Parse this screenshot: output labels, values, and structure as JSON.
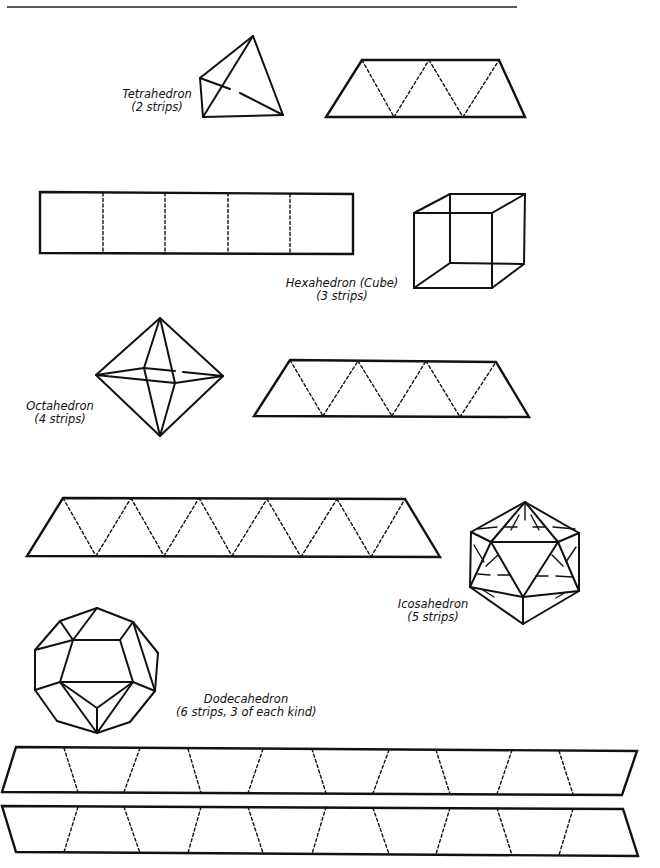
{
  "page": {
    "rule": {
      "x1": 7,
      "y1": 7,
      "x2": 517,
      "y2": 7
    },
    "colors": {
      "ink": "#111111",
      "paper": "#ffffff"
    }
  },
  "labels": {
    "tetrahedron": {
      "name": "Tetrahedron",
      "strips": "(2 strips)"
    },
    "hexahedron": {
      "name": "Hexahedron (Cube)",
      "strips": "(3 strips)"
    },
    "octahedron": {
      "name": "Octahedron",
      "strips": "(4 strips)"
    },
    "icosahedron": {
      "name": "Icosahedron",
      "strips": "(5 strips)"
    },
    "dodecahedron": {
      "name": "Dodecahedron",
      "strips": "(6 strips, 3 of each kind)"
    }
  },
  "solids": {
    "tetrahedron": {
      "solid": [
        [
          253,
          36,
          200,
          78
        ],
        [
          200,
          78,
          203,
          117
        ],
        [
          203,
          117,
          283,
          115
        ],
        [
          283,
          115,
          253,
          36
        ],
        [
          253,
          36,
          203,
          117
        ],
        [
          200,
          78,
          230,
          89
        ],
        [
          240,
          93,
          283,
          115
        ]
      ]
    },
    "cube": {
      "solid": [
        [
          414,
          213,
          492,
          213
        ],
        [
          492,
          213,
          492,
          288
        ],
        [
          492,
          288,
          414,
          288
        ],
        [
          414,
          288,
          414,
          213
        ],
        [
          414,
          213,
          450,
          194
        ],
        [
          450,
          194,
          525,
          194
        ],
        [
          525,
          194,
          492,
          213
        ],
        [
          525,
          194,
          524,
          264
        ],
        [
          524,
          264,
          492,
          288
        ],
        [
          414,
          288,
          450,
          263
        ],
        [
          450,
          263,
          524,
          264
        ],
        [
          450,
          194,
          450,
          263
        ]
      ]
    },
    "octahedron": {
      "solid": [
        [
          160,
          318,
          96,
          375
        ],
        [
          160,
          318,
          223,
          376
        ],
        [
          160,
          436,
          96,
          375
        ],
        [
          160,
          436,
          223,
          376
        ],
        [
          96,
          375,
          175,
          383
        ],
        [
          175,
          383,
          223,
          376
        ],
        [
          160,
          318,
          175,
          383
        ],
        [
          175,
          383,
          160,
          436
        ],
        [
          96,
          375,
          144,
          368
        ],
        [
          144,
          368,
          160,
          318
        ],
        [
          144,
          368,
          160,
          436
        ],
        [
          144,
          368,
          175,
          371
        ],
        [
          183,
          372,
          223,
          376
        ]
      ]
    },
    "icosahedron": {
      "solid": [
        [
          525,
          502,
          579,
          533
        ],
        [
          579,
          533,
          579,
          591
        ],
        [
          579,
          591,
          523,
          624
        ],
        [
          523,
          624,
          470,
          587
        ],
        [
          470,
          587,
          471,
          532
        ],
        [
          471,
          532,
          525,
          502
        ],
        [
          491,
          542,
          558,
          542
        ],
        [
          558,
          542,
          523,
          597
        ],
        [
          523,
          597,
          491,
          542
        ],
        [
          525,
          502,
          491,
          542
        ],
        [
          525,
          502,
          558,
          542
        ],
        [
          471,
          532,
          491,
          542
        ],
        [
          579,
          533,
          558,
          542
        ],
        [
          470,
          587,
          491,
          542
        ],
        [
          470,
          587,
          523,
          597
        ],
        [
          579,
          591,
          558,
          542
        ],
        [
          579,
          591,
          523,
          597
        ],
        [
          523,
          624,
          523,
          597
        ]
      ],
      "hidden": [
        [
          477,
          529,
          497,
          527
        ],
        [
          505,
          527,
          517,
          527
        ],
        [
          533,
          527,
          545,
          527
        ],
        [
          553,
          527,
          575,
          529
        ],
        [
          525,
          502,
          525,
          520
        ],
        [
          519,
          515,
          511,
          530
        ],
        [
          531,
          515,
          539,
          530
        ],
        [
          474,
          545,
          484,
          562
        ],
        [
          478,
          574,
          490,
          575
        ],
        [
          498,
          575,
          510,
          575
        ],
        [
          536,
          576,
          548,
          576
        ],
        [
          556,
          576,
          572,
          577
        ],
        [
          576,
          547,
          566,
          562
        ],
        [
          483,
          590,
          494,
          597
        ],
        [
          566,
          592,
          556,
          598
        ],
        [
          486,
          566,
          498,
          555
        ],
        [
          563,
          566,
          552,
          555
        ]
      ]
    },
    "dodecahedron": {
      "solid": [
        [
          97,
          608,
          133,
          622
        ],
        [
          133,
          622,
          158,
          653
        ],
        [
          158,
          653,
          155,
          691
        ],
        [
          155,
          691,
          130,
          722
        ],
        [
          130,
          722,
          97,
          733
        ],
        [
          97,
          733,
          57,
          721
        ],
        [
          57,
          721,
          35,
          690
        ],
        [
          35,
          690,
          35,
          650
        ],
        [
          35,
          650,
          60,
          621
        ],
        [
          60,
          621,
          97,
          608
        ],
        [
          73,
          640,
          120,
          640
        ],
        [
          120,
          640,
          133,
          682
        ],
        [
          133,
          682,
          97,
          708
        ],
        [
          97,
          708,
          60,
          682
        ],
        [
          60,
          682,
          73,
          640
        ],
        [
          73,
          640,
          60,
          621
        ],
        [
          73,
          640,
          35,
          650
        ],
        [
          73,
          640,
          97,
          608
        ],
        [
          120,
          640,
          133,
          622
        ],
        [
          133,
          622,
          155,
          691
        ],
        [
          133,
          682,
          155,
          691
        ],
        [
          60,
          682,
          35,
          690
        ],
        [
          60,
          682,
          97,
          733
        ],
        [
          133,
          682,
          97,
          733
        ],
        [
          97,
          708,
          97,
          733
        ],
        [
          60,
          682,
          133,
          682
        ]
      ]
    }
  },
  "strips": {
    "tetrahedron_strip": {
      "outline": [
        [
          362,
          60
        ],
        [
          499,
          60
        ],
        [
          525,
          117
        ],
        [
          326,
          117
        ]
      ],
      "folds": [
        [
          362,
          60,
          394,
          117
        ],
        [
          394,
          117,
          429,
          60
        ],
        [
          429,
          60,
          463,
          117
        ],
        [
          463,
          117,
          499,
          60
        ]
      ]
    },
    "cube_strip": {
      "outline": [
        [
          40,
          192
        ],
        [
          353,
          194
        ],
        [
          353,
          254
        ],
        [
          40,
          253
        ]
      ],
      "folds": [
        [
          103,
          193,
          103,
          253
        ],
        [
          165,
          193,
          165,
          254
        ],
        [
          228,
          193,
          228,
          254
        ],
        [
          290,
          194,
          290,
          254
        ]
      ]
    },
    "octahedron_strip": {
      "outline": [
        [
          290,
          360
        ],
        [
          496,
          362
        ],
        [
          529,
          417
        ],
        [
          254,
          416
        ]
      ],
      "folds": [
        [
          290,
          360,
          323,
          416
        ],
        [
          323,
          416,
          358,
          361
        ],
        [
          358,
          361,
          392,
          416
        ],
        [
          392,
          416,
          426,
          361
        ],
        [
          426,
          361,
          460,
          417
        ],
        [
          460,
          417,
          496,
          362
        ]
      ]
    },
    "icosahedron_strip": {
      "outline": [
        [
          63,
          498
        ],
        [
          405,
          499
        ],
        [
          440,
          557
        ],
        [
          27,
          556
        ]
      ],
      "folds": [
        [
          63,
          498,
          96,
          556
        ],
        [
          96,
          556,
          131,
          498
        ],
        [
          131,
          498,
          164,
          556
        ],
        [
          164,
          556,
          199,
          498
        ],
        [
          199,
          498,
          232,
          556
        ],
        [
          232,
          556,
          267,
          499
        ],
        [
          267,
          499,
          301,
          557
        ],
        [
          301,
          557,
          337,
          499
        ],
        [
          337,
          499,
          371,
          557
        ],
        [
          371,
          557,
          405,
          499
        ]
      ]
    },
    "dodecahedron_strip_1": {
      "outline": [
        [
          16,
          747
        ],
        [
          637,
          751
        ],
        [
          622,
          795
        ],
        [
          2,
          792
        ]
      ],
      "folds": [
        [
          64,
          748,
          78,
          792
        ],
        [
          140,
          748,
          124,
          792
        ],
        [
          188,
          749,
          201,
          793
        ],
        [
          263,
          749,
          248,
          793
        ],
        [
          312,
          749,
          326,
          793
        ],
        [
          389,
          750,
          373,
          793
        ],
        [
          436,
          750,
          450,
          794
        ],
        [
          512,
          750,
          497,
          794
        ],
        [
          559,
          751,
          573,
          794
        ]
      ]
    },
    "dodecahedron_strip_2": {
      "outline": [
        [
          2,
          806
        ],
        [
          623,
          809
        ],
        [
          638,
          856
        ],
        [
          16,
          852
        ]
      ],
      "folds": [
        [
          78,
          807,
          64,
          852
        ],
        [
          124,
          807,
          140,
          853
        ],
        [
          201,
          807,
          188,
          853
        ],
        [
          248,
          807,
          263,
          853
        ],
        [
          326,
          807,
          312,
          854
        ],
        [
          373,
          808,
          389,
          854
        ],
        [
          450,
          808,
          436,
          854
        ],
        [
          497,
          808,
          512,
          855
        ],
        [
          573,
          809,
          559,
          855
        ]
      ]
    }
  }
}
